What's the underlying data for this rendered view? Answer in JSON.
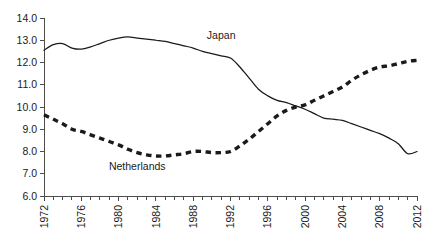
{
  "chart_data": {
    "type": "line",
    "title": "",
    "subtitle": "",
    "xlabel": "",
    "ylabel": "",
    "xlim": [
      1972,
      2012
    ],
    "ylim": [
      6.0,
      14.0
    ],
    "grid": false,
    "legend_position": "inline-annotation",
    "y_ticks": [
      "6.0",
      "7.0",
      "8.0",
      "9.0",
      "10.0",
      "11.0",
      "12.0",
      "13.0",
      "14.0"
    ],
    "y_tick_values": [
      6.0,
      7.0,
      8.0,
      9.0,
      10.0,
      11.0,
      12.0,
      13.0,
      14.0
    ],
    "x_ticks": [
      "1972",
      "1976",
      "1980",
      "1984",
      "1988",
      "1992",
      "1996",
      "2000",
      "2004",
      "2008",
      "2012"
    ],
    "x_tick_values": [
      1972,
      1976,
      1980,
      1984,
      1988,
      1992,
      1996,
      2000,
      2004,
      2008,
      2012
    ],
    "x_minor_tick_step": 1,
    "x": [
      1972,
      1973,
      1974,
      1975,
      1976,
      1977,
      1978,
      1979,
      1980,
      1981,
      1982,
      1983,
      1984,
      1985,
      1986,
      1987,
      1988,
      1989,
      1990,
      1991,
      1992,
      1993,
      1994,
      1995,
      1996,
      1997,
      1998,
      1999,
      2000,
      2001,
      2002,
      2003,
      2004,
      2005,
      2006,
      2007,
      2008,
      2009,
      2010,
      2011,
      2012
    ],
    "series": [
      {
        "name": "Japan",
        "style": "solid",
        "color": "#1a1a1a",
        "label_x": 1991,
        "label_y": 13.05,
        "values": [
          12.55,
          12.8,
          12.85,
          12.65,
          12.6,
          12.7,
          12.85,
          13.0,
          13.1,
          13.15,
          13.1,
          13.05,
          13.0,
          12.95,
          12.85,
          12.75,
          12.65,
          12.5,
          12.4,
          12.3,
          12.2,
          11.8,
          11.3,
          10.8,
          10.5,
          10.3,
          10.2,
          10.05,
          9.9,
          9.7,
          9.5,
          9.45,
          9.4,
          9.25,
          9.1,
          8.95,
          8.8,
          8.6,
          8.35,
          7.9,
          8.0
        ]
      },
      {
        "name": "Netherlands",
        "style": "dashed",
        "color": "#1a1a1a",
        "label_x": 1982,
        "label_y": 7.15,
        "values": [
          9.65,
          9.45,
          9.25,
          9.0,
          8.9,
          8.75,
          8.6,
          8.45,
          8.3,
          8.1,
          7.95,
          7.85,
          7.8,
          7.8,
          7.85,
          7.9,
          8.0,
          8.0,
          7.95,
          7.95,
          8.0,
          8.25,
          8.55,
          8.9,
          9.25,
          9.6,
          9.85,
          10.0,
          10.1,
          10.3,
          10.5,
          10.7,
          10.9,
          11.2,
          11.45,
          11.65,
          11.8,
          11.85,
          11.95,
          12.05,
          12.1
        ]
      }
    ]
  }
}
